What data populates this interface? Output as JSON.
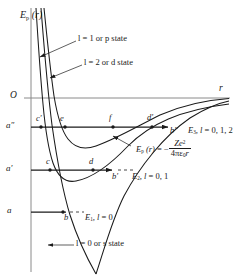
{
  "figure": {
    "type": "physics-potential-energy-diagram",
    "axes": {
      "y_axis_label": "Ep (r)",
      "y_axis_label_parts": {
        "symbol": "E",
        "subscript": "p",
        "arg": "(r)"
      },
      "x_axis_label": "r",
      "origin_label": "O"
    },
    "energy_levels": [
      {
        "tick_label": "a″",
        "level_label": "E3, l = 0, 1, 2",
        "level_parts": {
          "symbol": "E",
          "subscript": "3",
          "rest": ", l = 0, 1, 2"
        },
        "y": 127,
        "intersection_points": [
          "c′",
          "e",
          "f",
          "d′",
          "b″"
        ]
      },
      {
        "tick_label": "a′",
        "level_label": "E2, l = 0, 1",
        "level_parts": {
          "symbol": "E",
          "subscript": "2",
          "rest": ", l = 0, 1"
        },
        "y": 170,
        "intersection_points": [
          "c",
          "d",
          "b′"
        ]
      },
      {
        "tick_label": "a",
        "level_label": "E1, l = 0",
        "level_parts": {
          "symbol": "E",
          "subscript": "1",
          "rest": ", l = 0"
        },
        "y": 212,
        "intersection_points": [
          "b"
        ]
      }
    ],
    "curve_annotations": [
      {
        "id": "p-state",
        "text": "l = 1 or p state",
        "x": 78,
        "y": 39
      },
      {
        "id": "d-state",
        "text": "l = 2 or d state",
        "x": 84,
        "y": 63
      },
      {
        "id": "s-state",
        "text": "l = 0 or s state",
        "x": 76,
        "y": 243
      }
    ],
    "formula": {
      "lead": "Ep (r) = −",
      "lead_parts": {
        "symbol": "E",
        "subscript": "p",
        "arg": "(r) = −"
      },
      "numerator": "Ze2",
      "numerator_parts": {
        "base": "Ze",
        "exponent": "2"
      },
      "denominator": "4πε0r",
      "denominator_parts": {
        "lead": "4πε",
        "subscript": "0",
        "tail": "r"
      },
      "full": "Ep (r) = − Ze² / 4πε0r"
    },
    "point_markers": [
      {
        "label": "c′",
        "x": 41,
        "y": 127
      },
      {
        "label": "e",
        "x": 65,
        "y": 127
      },
      {
        "label": "f",
        "x": 113,
        "y": 127
      },
      {
        "label": "d′",
        "x": 152,
        "y": 127
      },
      {
        "label": "b″",
        "x": 169,
        "y": 127
      },
      {
        "label": "c",
        "x": 50,
        "y": 170
      },
      {
        "label": "d",
        "x": 93,
        "y": 170
      },
      {
        "label": "b′",
        "x": 113,
        "y": 170
      },
      {
        "label": "b",
        "x": 63,
        "y": 212
      }
    ],
    "colors": {
      "curve": "#1a1a1a",
      "axis": "#8a8a8a",
      "level_line": "#1a1a1a",
      "background": "#ffffff"
    }
  }
}
